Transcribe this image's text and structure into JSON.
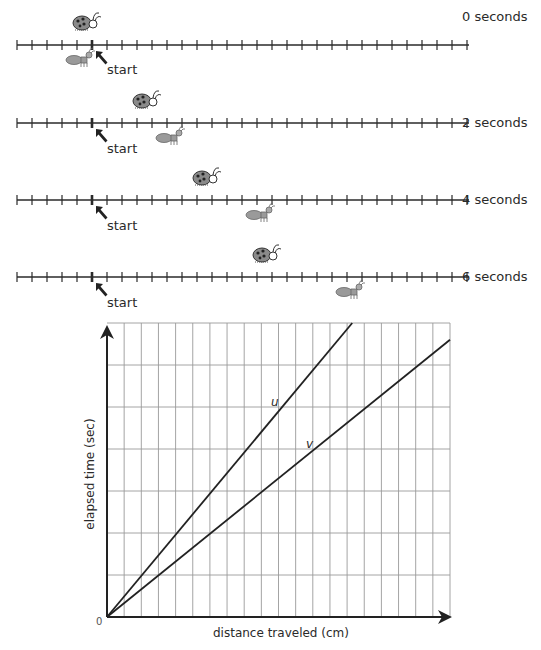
{
  "number_lines": [
    {
      "time_label": "0 seconds",
      "start_label": "start",
      "ladybug_tick": 5,
      "ant_tick": 5
    },
    {
      "time_label": "2 seconds",
      "start_label": "start",
      "ladybug_tick": 9,
      "ant_tick": 11
    },
    {
      "time_label": "4 seconds",
      "start_label": "start",
      "ladybug_tick": 13,
      "ant_tick": 17
    },
    {
      "time_label": "6 seconds",
      "start_label": "start",
      "ladybug_tick": 17,
      "ant_tick": 23
    }
  ],
  "graph": {
    "x_axis_label": "distance traveled (cm)",
    "y_axis_label": "elapsed time (sec)",
    "origin_label": "0",
    "line_u_label": "u",
    "line_v_label": "v"
  },
  "chart_data": {
    "type": "line",
    "title": "",
    "xlabel": "distance traveled (cm)",
    "ylabel": "elapsed time (sec)",
    "grid": true,
    "x_gridlines": 20,
    "y_gridlines": 7,
    "series": [
      {
        "name": "u",
        "x": [
          0,
          14.3
        ],
        "y": [
          0,
          7
        ]
      },
      {
        "name": "v",
        "x": [
          0,
          20
        ],
        "y": [
          0,
          6.6
        ]
      }
    ]
  },
  "colors": {
    "line": "#2a2a2a",
    "grid": "#9a9a9a",
    "creature": "#7a7a7a"
  }
}
